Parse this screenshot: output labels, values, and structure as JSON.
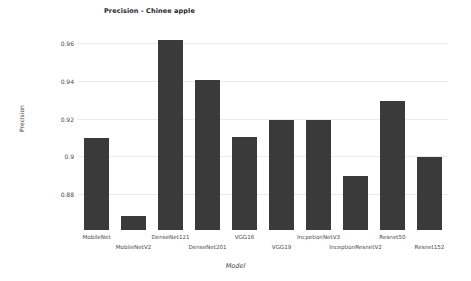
{
  "chart_data": {
    "type": "bar",
    "title": "Precision - Chinee apple",
    "xlabel": "Model",
    "ylabel": "Precision",
    "categories": [
      "MobileNet",
      "MobileNetV2",
      "DenseNet121",
      "DenseNet201",
      "VGG16",
      "VGG19",
      "IncpetionNetV3",
      "InceptionResnetV2",
      "Resnet50",
      "Resnet152"
    ],
    "values": [
      0.91,
      0.869,
      0.962,
      0.941,
      0.911,
      0.92,
      0.92,
      0.89,
      0.93,
      0.9
    ],
    "ylim": [
      0.8615,
      0.9685
    ],
    "ytick_values": [
      0.88,
      0.9,
      0.92,
      0.94,
      0.96
    ],
    "ytick_labels": [
      "0.88",
      "0.9",
      "0.92",
      "0.94",
      "0.96"
    ],
    "grid": true,
    "legend": null,
    "bar_color": "#3a3a3a",
    "grid_color": "#eaeaea",
    "background_color": "#ffffff"
  }
}
